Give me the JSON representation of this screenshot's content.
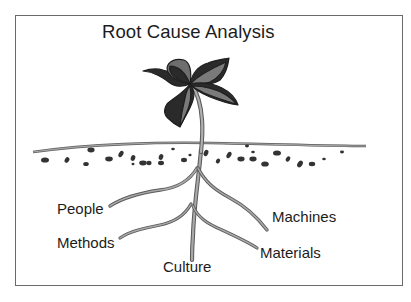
{
  "diagram": {
    "title": "Root Cause Analysis",
    "metaphor": "plant-with-roots",
    "roots": [
      {
        "label": "People"
      },
      {
        "label": "Methods"
      },
      {
        "label": "Culture"
      },
      {
        "label": "Machines"
      },
      {
        "label": "Materials"
      }
    ]
  },
  "colors": {
    "frame": "#6a6a6a",
    "text": "#1c1c1c",
    "leaf_dark": "#2a2a2a",
    "leaf_mid": "#7a7a7a",
    "root_fill": "#9a9a9a",
    "root_edge": "#5a5a5a",
    "soil_stones": "#3a3a3a",
    "ground_line": "#7a7a7a"
  }
}
